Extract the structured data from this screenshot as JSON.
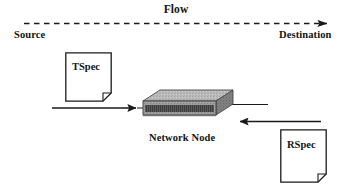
{
  "diagram": {
    "labels": {
      "flow": "Flow",
      "source": "Source",
      "destination": "Destination",
      "network_node": "Network Node"
    },
    "documents": [
      {
        "id": "tspec",
        "label": "TSpec"
      },
      {
        "id": "rspec",
        "label": "RSpec"
      }
    ],
    "arrows": [
      {
        "id": "flow-arrow",
        "style": "dashed",
        "direction": "right",
        "from_x": 24,
        "to_x": 330,
        "y": 23
      },
      {
        "id": "tspec-arrow",
        "style": "solid",
        "direction": "right",
        "from_x": 52,
        "to_x": 140,
        "y": 108
      },
      {
        "id": "rspec-arrow",
        "style": "solid",
        "direction": "left",
        "from_x": 320,
        "to_x": 236,
        "y": 122
      }
    ],
    "node": {
      "label": "Network Node",
      "shape": "3d-box",
      "x": 143,
      "y": 89,
      "width": 90,
      "height": 38
    },
    "colors": {
      "stroke": "#1a1a1a",
      "text": "#141414",
      "background": "#ffffff",
      "node_top": "#b4b4b4",
      "node_front": "#9a9a9a",
      "node_band": "#5e5e5e",
      "node_side": "#7d7d7d"
    }
  }
}
